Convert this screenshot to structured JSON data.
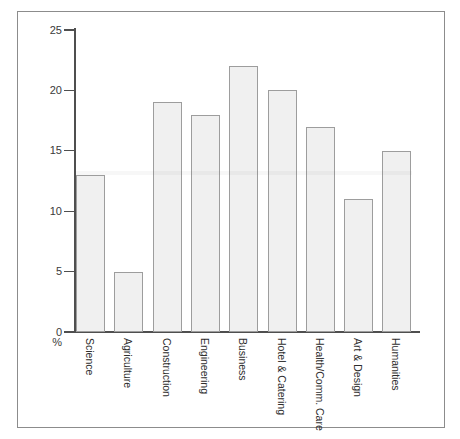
{
  "chart_data": {
    "type": "bar",
    "title": "",
    "categories": [
      "Science",
      "Agriculture",
      "Construction",
      "Engineering",
      "Business",
      "Hotel & Catering",
      "Health/Comm. Care",
      "Art & Design",
      "Humanities"
    ],
    "values": [
      13,
      5,
      19,
      18,
      22,
      20,
      17,
      11,
      15
    ],
    "xlabel": "",
    "ylabel": "%",
    "ylim": [
      0,
      25
    ],
    "yticks": [
      0,
      5,
      10,
      15,
      20,
      25
    ],
    "grid": false,
    "category_labels_rotated": true,
    "colors": {
      "bar_fill": "#f0f0f0",
      "bar_border": "#9d9d9d",
      "axis": "#4f4f4f",
      "text": "#3a3a3a",
      "frame_border": "#8c8c8c",
      "background": "#ffffff"
    }
  }
}
